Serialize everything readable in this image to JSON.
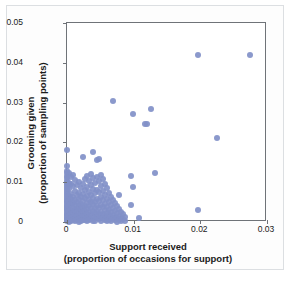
{
  "chart_data": {
    "type": "scatter",
    "title": "",
    "xlabel": "Support received (proportion of occasions for support)",
    "ylabel": "Grooming given (proportion of sampling points)",
    "xlabel_line1": "Support received",
    "xlabel_line2": "(proportion of occasions for support)",
    "ylabel_line1": "Grooming given",
    "ylabel_line2": "(proportion of sampling points)",
    "xlim": [
      0,
      0.03
    ],
    "ylim": [
      0,
      0.05
    ],
    "xticks": [
      0,
      0.01,
      0.02,
      0.03
    ],
    "xticklabels": [
      "0",
      "0.01",
      "0.02",
      "0.03"
    ],
    "yticks": [
      0,
      0.01,
      0.02,
      0.03,
      0.04,
      0.05
    ],
    "yticklabels": [
      "0",
      "0.01",
      "0.02",
      "0.03",
      "0.04",
      "0.05"
    ],
    "grid": false,
    "legend": null,
    "marker_color": "#8190c8",
    "marker_size_px": 6,
    "frame_color": "#6f7378",
    "background": "#ffffff",
    "points": [
      [
        0.0,
        0.0182
      ],
      [
        0.0,
        0.014
      ],
      [
        0.0,
        0.0128
      ],
      [
        0.0,
        0.0122
      ],
      [
        0.0,
        0.0116
      ],
      [
        0.0,
        0.011
      ],
      [
        0.0,
        0.0104
      ],
      [
        0.0,
        0.0099
      ],
      [
        0.0,
        0.0094
      ],
      [
        0.0,
        0.0089
      ],
      [
        0.0,
        0.0084
      ],
      [
        0.0,
        0.0079
      ],
      [
        0.0,
        0.0074
      ],
      [
        0.0,
        0.0069
      ],
      [
        0.0,
        0.0064
      ],
      [
        0.0,
        0.0059
      ],
      [
        0.0,
        0.0054
      ],
      [
        0.0,
        0.0049
      ],
      [
        0.0,
        0.0045
      ],
      [
        0.0,
        0.0041
      ],
      [
        0.0,
        0.0037
      ],
      [
        0.0,
        0.0033
      ],
      [
        0.0,
        0.0029
      ],
      [
        0.0,
        0.0025
      ],
      [
        0.0,
        0.0021
      ],
      [
        0.0,
        0.0017
      ],
      [
        0.0,
        0.0013
      ],
      [
        0.0,
        0.0009
      ],
      [
        0.0,
        0.0005
      ],
      [
        0.0,
        0.0002
      ],
      [
        0.0003,
        0.0124
      ],
      [
        0.0003,
        0.0098
      ],
      [
        0.0003,
        0.0083
      ],
      [
        0.0003,
        0.0066
      ],
      [
        0.0003,
        0.0052
      ],
      [
        0.0003,
        0.004
      ],
      [
        0.0003,
        0.0028
      ],
      [
        0.0003,
        0.0016
      ],
      [
        0.0003,
        0.0006
      ],
      [
        0.0003,
        0.0001
      ],
      [
        0.0006,
        0.0112
      ],
      [
        0.0006,
        0.0096
      ],
      [
        0.0006,
        0.0071
      ],
      [
        0.0006,
        0.0058
      ],
      [
        0.0006,
        0.0044
      ],
      [
        0.0006,
        0.0031
      ],
      [
        0.0006,
        0.002
      ],
      [
        0.0006,
        0.001
      ],
      [
        0.0006,
        0.0003
      ],
      [
        0.0009,
        0.0118
      ],
      [
        0.0009,
        0.009
      ],
      [
        0.0009,
        0.0062
      ],
      [
        0.0009,
        0.0048
      ],
      [
        0.0009,
        0.0035
      ],
      [
        0.0009,
        0.0022
      ],
      [
        0.0009,
        0.0012
      ],
      [
        0.0009,
        0.0004
      ],
      [
        0.0012,
        0.0106
      ],
      [
        0.0012,
        0.0078
      ],
      [
        0.0012,
        0.0055
      ],
      [
        0.0012,
        0.0042
      ],
      [
        0.0012,
        0.003
      ],
      [
        0.0012,
        0.0018
      ],
      [
        0.0012,
        0.0008
      ],
      [
        0.0012,
        0.0002
      ],
      [
        0.0015,
        0.0092
      ],
      [
        0.0015,
        0.0068
      ],
      [
        0.0015,
        0.005
      ],
      [
        0.0015,
        0.0036
      ],
      [
        0.0015,
        0.0024
      ],
      [
        0.0015,
        0.0014
      ],
      [
        0.0015,
        0.0005
      ],
      [
        0.0018,
        0.01
      ],
      [
        0.0018,
        0.0074
      ],
      [
        0.0018,
        0.0057
      ],
      [
        0.0018,
        0.0043
      ],
      [
        0.0018,
        0.0029
      ],
      [
        0.0018,
        0.0017
      ],
      [
        0.0018,
        0.0007
      ],
      [
        0.0018,
        0.0001
      ],
      [
        0.0021,
        0.0086
      ],
      [
        0.0021,
        0.0064
      ],
      [
        0.0021,
        0.0046
      ],
      [
        0.0021,
        0.0033
      ],
      [
        0.0021,
        0.0021
      ],
      [
        0.0021,
        0.0011
      ],
      [
        0.0021,
        0.0003
      ],
      [
        0.0024,
        0.0164
      ],
      [
        0.0024,
        0.0095
      ],
      [
        0.0024,
        0.007
      ],
      [
        0.0024,
        0.0053
      ],
      [
        0.0024,
        0.0038
      ],
      [
        0.0024,
        0.0026
      ],
      [
        0.0024,
        0.0015
      ],
      [
        0.0024,
        0.0006
      ],
      [
        0.0027,
        0.0108
      ],
      [
        0.0027,
        0.0081
      ],
      [
        0.0027,
        0.006
      ],
      [
        0.0027,
        0.0041
      ],
      [
        0.0027,
        0.0028
      ],
      [
        0.0027,
        0.0016
      ],
      [
        0.0027,
        0.0005
      ],
      [
        0.003,
        0.0115
      ],
      [
        0.003,
        0.0088
      ],
      [
        0.003,
        0.0065
      ],
      [
        0.003,
        0.0047
      ],
      [
        0.003,
        0.0032
      ],
      [
        0.003,
        0.0019
      ],
      [
        0.003,
        0.0009
      ],
      [
        0.003,
        0.0002
      ],
      [
        0.0033,
        0.0102
      ],
      [
        0.0033,
        0.0076
      ],
      [
        0.0033,
        0.0056
      ],
      [
        0.0033,
        0.0039
      ],
      [
        0.0033,
        0.0025
      ],
      [
        0.0033,
        0.0013
      ],
      [
        0.0033,
        0.0004
      ],
      [
        0.0036,
        0.0121
      ],
      [
        0.0036,
        0.0093
      ],
      [
        0.0036,
        0.0067
      ],
      [
        0.0036,
        0.0049
      ],
      [
        0.0036,
        0.0034
      ],
      [
        0.0036,
        0.002
      ],
      [
        0.0036,
        0.0008
      ],
      [
        0.0039,
        0.0175
      ],
      [
        0.0039,
        0.011
      ],
      [
        0.0039,
        0.0084
      ],
      [
        0.0039,
        0.0061
      ],
      [
        0.0039,
        0.0044
      ],
      [
        0.0039,
        0.0027
      ],
      [
        0.0039,
        0.0014
      ],
      [
        0.0039,
        0.0003
      ],
      [
        0.0042,
        0.0099
      ],
      [
        0.0042,
        0.0072
      ],
      [
        0.0042,
        0.0051
      ],
      [
        0.0042,
        0.0036
      ],
      [
        0.0042,
        0.0022
      ],
      [
        0.0042,
        0.001
      ],
      [
        0.0042,
        0.0002
      ],
      [
        0.0045,
        0.0155
      ],
      [
        0.0045,
        0.0113
      ],
      [
        0.0045,
        0.008
      ],
      [
        0.0045,
        0.0058
      ],
      [
        0.0045,
        0.004
      ],
      [
        0.0045,
        0.0024
      ],
      [
        0.0045,
        0.0012
      ],
      [
        0.0048,
        0.0158
      ],
      [
        0.0048,
        0.0104
      ],
      [
        0.0048,
        0.0075
      ],
      [
        0.0048,
        0.0052
      ],
      [
        0.0048,
        0.0035
      ],
      [
        0.0048,
        0.0019
      ],
      [
        0.0048,
        0.0007
      ],
      [
        0.0051,
        0.0118
      ],
      [
        0.0051,
        0.009
      ],
      [
        0.0051,
        0.0063
      ],
      [
        0.0051,
        0.0042
      ],
      [
        0.0051,
        0.0026
      ],
      [
        0.0051,
        0.0013
      ],
      [
        0.0051,
        0.0003
      ],
      [
        0.0054,
        0.0107
      ],
      [
        0.0054,
        0.0079
      ],
      [
        0.0054,
        0.0055
      ],
      [
        0.0054,
        0.0037
      ],
      [
        0.0054,
        0.0021
      ],
      [
        0.0054,
        0.0009
      ],
      [
        0.0057,
        0.0096
      ],
      [
        0.0057,
        0.0068
      ],
      [
        0.0057,
        0.0046
      ],
      [
        0.0057,
        0.003
      ],
      [
        0.0057,
        0.0016
      ],
      [
        0.0057,
        0.0005
      ],
      [
        0.006,
        0.0085
      ],
      [
        0.006,
        0.0059
      ],
      [
        0.006,
        0.0038
      ],
      [
        0.006,
        0.0023
      ],
      [
        0.006,
        0.0011
      ],
      [
        0.006,
        0.0002
      ],
      [
        0.0063,
        0.0073
      ],
      [
        0.0063,
        0.005
      ],
      [
        0.0063,
        0.0031
      ],
      [
        0.0063,
        0.0017
      ],
      [
        0.0063,
        0.0006
      ],
      [
        0.0066,
        0.0064
      ],
      [
        0.0066,
        0.0042
      ],
      [
        0.0066,
        0.0026
      ],
      [
        0.0066,
        0.0012
      ],
      [
        0.0066,
        0.0003
      ],
      [
        0.0069,
        0.0303
      ],
      [
        0.0069,
        0.0056
      ],
      [
        0.0069,
        0.0034
      ],
      [
        0.0069,
        0.0018
      ],
      [
        0.0069,
        0.0007
      ],
      [
        0.0072,
        0.0048
      ],
      [
        0.0072,
        0.0028
      ],
      [
        0.0072,
        0.0013
      ],
      [
        0.0072,
        0.0004
      ],
      [
        0.0075,
        0.004
      ],
      [
        0.0075,
        0.0022
      ],
      [
        0.0075,
        0.0009
      ],
      [
        0.0075,
        0.0001
      ],
      [
        0.0078,
        0.0068
      ],
      [
        0.0078,
        0.0033
      ],
      [
        0.0078,
        0.0015
      ],
      [
        0.0078,
        0.0005
      ],
      [
        0.0081,
        0.0026
      ],
      [
        0.0081,
        0.001
      ],
      [
        0.0081,
        0.0002
      ],
      [
        0.0084,
        0.0019
      ],
      [
        0.0084,
        0.0007
      ],
      [
        0.0087,
        0.0012
      ],
      [
        0.0087,
        0.0003
      ],
      [
        0.0096,
        0.0116
      ],
      [
        0.0096,
        0.0042
      ],
      [
        0.0099,
        0.0272
      ],
      [
        0.0099,
        0.0088
      ],
      [
        0.0108,
        0.0011
      ],
      [
        0.0117,
        0.0247
      ],
      [
        0.012,
        0.0247
      ],
      [
        0.0126,
        0.0283
      ],
      [
        0.0132,
        0.0124
      ],
      [
        0.0196,
        0.0419
      ],
      [
        0.0197,
        0.0031
      ],
      [
        0.0225,
        0.0212
      ],
      [
        0.0274,
        0.0419
      ]
    ]
  }
}
